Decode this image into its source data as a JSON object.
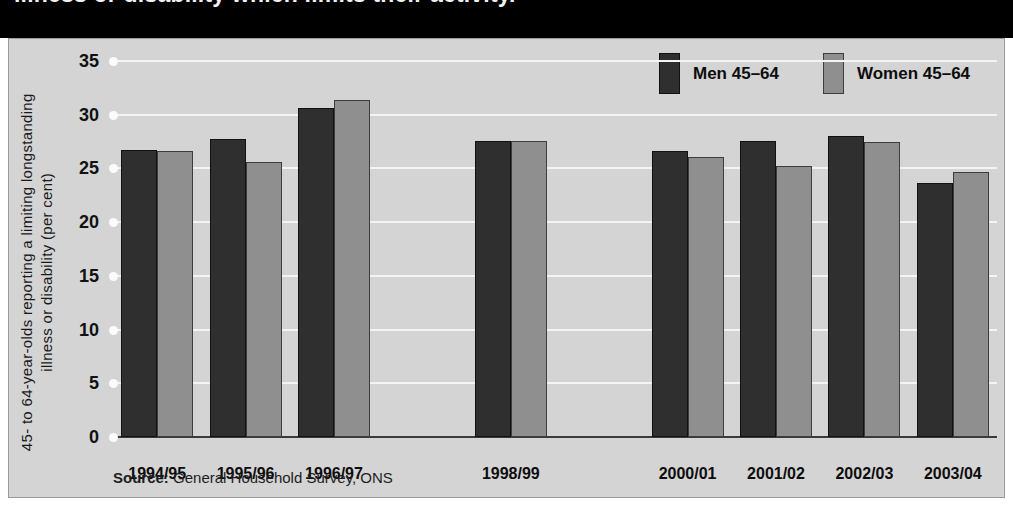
{
  "title": {
    "text": "illness or disability which limits their activity."
  },
  "legend": {
    "items": [
      {
        "label": "Men 45–64",
        "color": "#2f2f2f",
        "swatch": "men-swatch"
      },
      {
        "label": "Women 45–64",
        "color": "#8f8f8f",
        "swatch": "women-swatch"
      }
    ]
  },
  "source": {
    "key": "Source:",
    "value": " General Household Survey, ONS"
  },
  "chart_data": {
    "type": "bar",
    "title": "illness or disability which limits their activity.",
    "xlabel": "",
    "ylabel": "45- to 64-year-olds reporting a limiting longstanding illness or disability (per cent)",
    "ylim": [
      0,
      35
    ],
    "yticks": [
      0,
      5,
      10,
      15,
      20,
      25,
      30,
      35
    ],
    "ytick_labels": [
      "0",
      "5",
      "10",
      "15",
      "20",
      "25",
      "30",
      "35"
    ],
    "grid": true,
    "legend_position": "top-right",
    "categories": [
      "1994/95",
      "1995/96",
      "1996/97",
      "",
      "1998/99",
      "",
      "2000/01",
      "2001/02",
      "2002/03",
      "2003/04"
    ],
    "series": [
      {
        "name": "Men 45–64",
        "color": "#2f2f2f",
        "values": [
          26.7,
          27.7,
          30.6,
          null,
          27.6,
          null,
          26.6,
          27.6,
          28.0,
          23.6
        ]
      },
      {
        "name": "Women 45–64",
        "color": "#8f8f8f",
        "values": [
          26.6,
          25.6,
          31.4,
          null,
          27.6,
          null,
          26.1,
          25.2,
          27.5,
          24.7
        ]
      }
    ]
  }
}
